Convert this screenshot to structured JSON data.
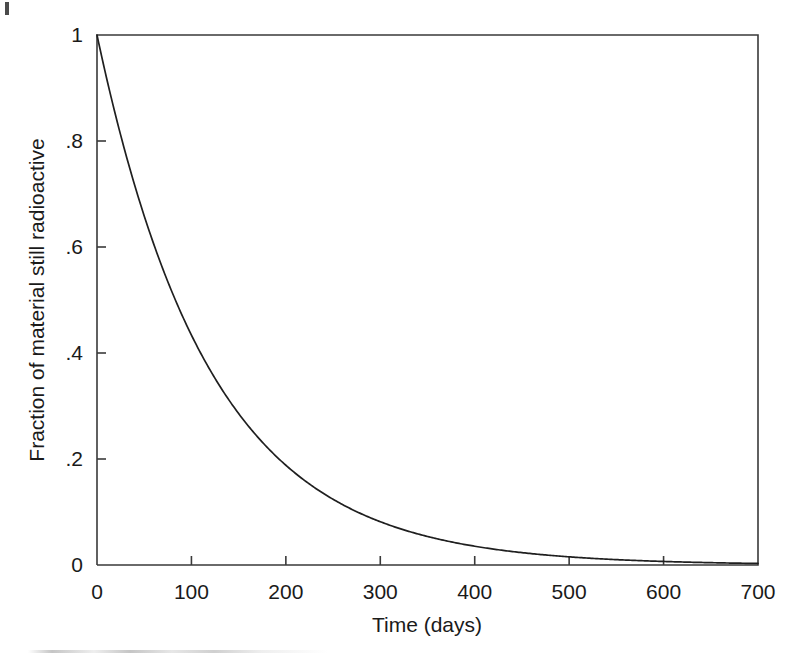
{
  "figure": {
    "background_color": "#ffffff",
    "line_color": "#1f1f1f",
    "axis_color": "#3a3a3a"
  },
  "chart_data": {
    "type": "line",
    "title": "",
    "subtitle": "",
    "xlabel": "Time (days)",
    "ylabel": "Fraction of material still radioactive",
    "xlim": [
      0,
      700
    ],
    "ylim": [
      0,
      1
    ],
    "xticks": [
      0,
      100,
      200,
      300,
      400,
      500,
      600,
      700
    ],
    "xticklabels": [
      "0",
      "100",
      "200",
      "300",
      "400",
      "500",
      "600",
      "700"
    ],
    "yticks": [
      0,
      0.2,
      0.4,
      0.6,
      0.8,
      1
    ],
    "yticklabels": [
      "0",
      ".2",
      ".4",
      ".6",
      ".8",
      "1"
    ],
    "grid": false,
    "legend": false,
    "legend_position": "none",
    "annotations": [],
    "model": {
      "equation": "N/N0 = 0.5^(t/T)",
      "half_life_days": 83,
      "decay_constant_per_day": 0.00835
    },
    "series": [
      {
        "name": "Fraction remaining",
        "color": "#1f1f1f",
        "x": [
          0,
          25,
          50,
          75,
          100,
          125,
          150,
          175,
          200,
          225,
          250,
          275,
          300,
          325,
          350,
          375,
          400,
          425,
          450,
          475,
          500,
          525,
          550,
          575,
          600,
          625,
          650,
          675,
          700
        ],
        "y": [
          1.0,
          0.812,
          0.659,
          0.535,
          0.434,
          0.353,
          0.286,
          0.232,
          0.189,
          0.153,
          0.124,
          0.101,
          0.082,
          0.066,
          0.054,
          0.044,
          0.036,
          0.029,
          0.023,
          0.019,
          0.015,
          0.012,
          0.01,
          0.008,
          0.007,
          0.005,
          0.004,
          0.004,
          0.003
        ]
      }
    ]
  },
  "axis_titles": {
    "x": "Time (days)",
    "y": "Fraction of material still radioactive"
  }
}
